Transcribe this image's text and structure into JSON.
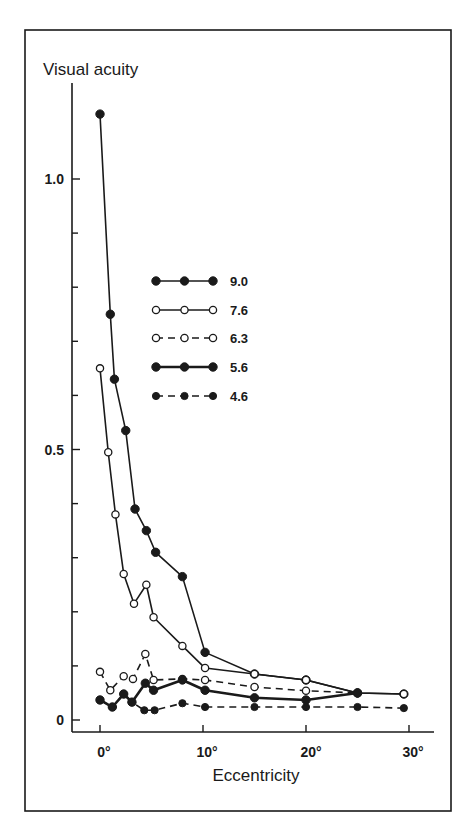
{
  "chart_data": {
    "type": "line",
    "title": "",
    "ylabel": "Visual acuity",
    "xlabel": "Eccentricity",
    "xlim": [
      -2.5,
      32
    ],
    "ylim": [
      0,
      1.15
    ],
    "x_ticks": [
      0,
      10,
      20,
      30
    ],
    "x_tick_labels": [
      "0°",
      "10°",
      "20°",
      "30°"
    ],
    "y_major_ticks": [
      0,
      0.5,
      1.0
    ],
    "y_tick_labels": [
      "0",
      "0.5",
      "1.0"
    ],
    "y_minor_ticks": [
      0.1,
      0.2,
      0.3,
      0.4,
      0.6,
      0.7,
      0.8,
      0.9
    ],
    "grid": false,
    "legend_position": "upper center",
    "series": [
      {
        "name": "9.0",
        "marker": "filled",
        "line": "solid",
        "x": [
          0,
          1,
          1.4,
          2.5,
          3.4,
          4.5,
          5.4,
          8,
          10.2,
          15,
          20,
          25,
          29.5
        ],
        "y": [
          1.12,
          0.75,
          0.63,
          0.535,
          0.39,
          0.35,
          0.31,
          0.265,
          0.125,
          0.085,
          0.074,
          0.05,
          0.048
        ]
      },
      {
        "name": "7.6",
        "marker": "open",
        "line": "solid",
        "x": [
          0,
          0.8,
          1.5,
          2.3,
          3.3,
          4.5,
          5.2,
          8,
          10.2,
          15,
          20,
          25,
          29.5
        ],
        "y": [
          0.65,
          0.495,
          0.38,
          0.27,
          0.215,
          0.25,
          0.19,
          0.137,
          0.096,
          0.085,
          0.074,
          0.05,
          0.048
        ]
      },
      {
        "name": "6.3",
        "marker": "open",
        "line": "dashed",
        "x": [
          0,
          1,
          2.3,
          3.2,
          4.4,
          5.2,
          8,
          10.2,
          15,
          20,
          25
        ],
        "y": [
          0.089,
          0.055,
          0.081,
          0.076,
          0.122,
          0.074,
          0.076,
          0.074,
          0.061,
          0.054,
          0.05
        ]
      },
      {
        "name": "5.6",
        "marker": "filled",
        "line": "solid-thick",
        "x": [
          0,
          1.2,
          2.3,
          3.1,
          4.4,
          5.2,
          8,
          10.2,
          15,
          20,
          25
        ],
        "y": [
          0.037,
          0.024,
          0.048,
          0.033,
          0.068,
          0.055,
          0.074,
          0.055,
          0.041,
          0.037,
          0.05
        ]
      },
      {
        "name": "4.6",
        "marker": "filled",
        "line": "dashed",
        "x": [
          0,
          1.2,
          2.3,
          3.1,
          4.3,
          5.3,
          8,
          10.2,
          15,
          20,
          25,
          29.5
        ],
        "y": [
          0.037,
          0.024,
          0.048,
          0.033,
          0.018,
          0.018,
          0.031,
          0.024,
          0.024,
          0.024,
          0.024,
          0.022
        ]
      }
    ]
  },
  "labels": {
    "ylabel": "Visual acuity",
    "xlabel": "Eccentricity",
    "y_ticks": [
      "1.0",
      "0.5",
      "0"
    ],
    "x_ticks": [
      "0°",
      "10°",
      "20°",
      "30°"
    ],
    "legend": [
      "9.0",
      "7.6",
      "6.3",
      "5.6",
      "4.6"
    ]
  },
  "colors": {
    "ink": "#1a1a1a",
    "background": "#ffffff"
  }
}
